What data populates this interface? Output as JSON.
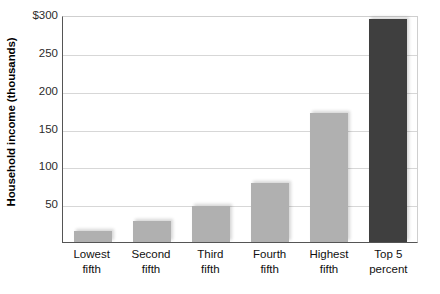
{
  "chart_data": {
    "type": "bar",
    "title": "",
    "subtitle": "",
    "xlabel": "",
    "ylabel": "Household income (thousands)",
    "categories": [
      "Lowest fifth",
      "Second fifth",
      "Third fifth",
      "Fourth fifth",
      "Highest fifth",
      "Top 5 percent"
    ],
    "category_lines": [
      [
        "Lowest",
        "fifth"
      ],
      [
        "Second",
        "fifth"
      ],
      [
        "Third",
        "fifth"
      ],
      [
        "Fourth",
        "fifth"
      ],
      [
        "Highest",
        "fifth"
      ],
      [
        "Top 5",
        "percent"
      ]
    ],
    "values": [
      15,
      28,
      47,
      78,
      170,
      295
    ],
    "ylim": [
      0,
      300
    ],
    "yticks": [
      50,
      100,
      150,
      200,
      250,
      300
    ],
    "ytick_labels": [
      "50",
      "100",
      "150",
      "200",
      "250",
      "$300"
    ],
    "grid": true,
    "legend": "none",
    "bar_colors": [
      "#b0b0b0",
      "#b0b0b0",
      "#b0b0b0",
      "#b0b0b0",
      "#b0b0b0",
      "#3f3f3f"
    ],
    "colors": {
      "bar_light": "#b0b0b0",
      "bar_dark": "#3f3f3f",
      "gridline": "#d7d7d7",
      "axis": "#555555",
      "text": "#1a1a1a",
      "background": "#ffffff"
    }
  }
}
